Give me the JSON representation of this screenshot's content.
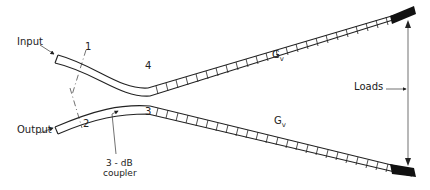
{
  "diagram": {
    "type": "waveguide 3-dB coupler with tapered loaded arms",
    "labels": {
      "input": "Input",
      "output": "Output",
      "port1": "1",
      "port2": "2",
      "port3": "3",
      "port4": "4",
      "arm_upper_gain": "G",
      "arm_upper_gain_sub": "v",
      "arm_lower_gain": "G",
      "arm_lower_gain_sub": "v",
      "loads": "Loads",
      "coupler_line1": "3 - dB",
      "coupler_line2": "coupler"
    },
    "colors": {
      "stroke": "#222222",
      "background": "#ffffff"
    }
  }
}
